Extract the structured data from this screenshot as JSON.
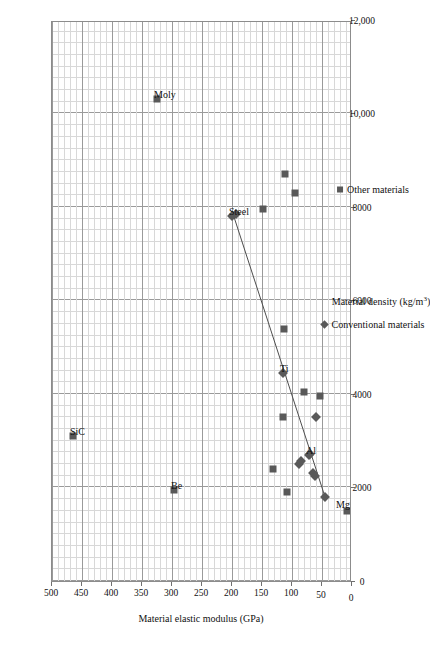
{
  "chart_data": {
    "type": "scatter",
    "title": "",
    "xlabel": "Material density (kg/m³)",
    "ylabel": "Material elastic modulus (GPa)",
    "xlim": [
      0,
      12000
    ],
    "ylim": [
      0,
      500
    ],
    "x_major_ticks": [
      0,
      2000,
      4000,
      6000,
      8000,
      10000,
      12000
    ],
    "x_tick_labels": [
      "0",
      "2000",
      "4000",
      "6000",
      "8000",
      "10,000",
      "12,000"
    ],
    "y_major_ticks": [
      0,
      50,
      100,
      150,
      200,
      250,
      300,
      350,
      400,
      450,
      500
    ],
    "y_tick_labels": [
      "0",
      "50",
      "100",
      "150",
      "200",
      "250",
      "300",
      "350",
      "400",
      "450",
      "500"
    ],
    "x_minor_step": 250,
    "y_minor_step": 10,
    "grid": "both",
    "rotation_deg": -90,
    "legend_position": "bottom",
    "legend": [
      {
        "name": "Conventional materials",
        "marker": "diamond",
        "color": "#595959"
      },
      {
        "name": "Other materials",
        "marker": "square",
        "color": "#595959"
      }
    ],
    "series": [
      {
        "name": "Conventional materials",
        "marker": "diamond",
        "color": "#595959",
        "points": [
          {
            "x": 7800,
            "y": 200,
            "label": "Steel"
          },
          {
            "x": 7850,
            "y": 193,
            "label": ""
          },
          {
            "x": 4450,
            "y": 115,
            "label": "Ti"
          },
          {
            "x": 3500,
            "y": 60,
            "label": ""
          },
          {
            "x": 2700,
            "y": 72,
            "label": "Al"
          },
          {
            "x": 2710,
            "y": 70,
            "label": ""
          },
          {
            "x": 2500,
            "y": 88,
            "label": ""
          },
          {
            "x": 2560,
            "y": 85,
            "label": ""
          },
          {
            "x": 2250,
            "y": 62,
            "label": ""
          },
          {
            "x": 2320,
            "y": 65,
            "label": ""
          },
          {
            "x": 1800,
            "y": 45,
            "label": "Mg"
          }
        ]
      },
      {
        "name": "Other materials",
        "marker": "square",
        "color": "#595959",
        "points": [
          {
            "x": 10300,
            "y": 325,
            "label": "Moly"
          },
          {
            "x": 8700,
            "y": 112,
            "label": ""
          },
          {
            "x": 8300,
            "y": 95,
            "label": ""
          },
          {
            "x": 7950,
            "y": 148,
            "label": ""
          },
          {
            "x": 5400,
            "y": 113,
            "label": ""
          },
          {
            "x": 4050,
            "y": 80,
            "label": ""
          },
          {
            "x": 3950,
            "y": 53,
            "label": ""
          },
          {
            "x": 3500,
            "y": 115,
            "label": ""
          },
          {
            "x": 3100,
            "y": 465,
            "label": "SiC"
          },
          {
            "x": 2400,
            "y": 132,
            "label": ""
          },
          {
            "x": 1950,
            "y": 297,
            "label": "Be"
          },
          {
            "x": 1900,
            "y": 108,
            "label": ""
          },
          {
            "x": 1500,
            "y": 8,
            "label": ""
          }
        ]
      }
    ],
    "trendline": {
      "name": "linear trend",
      "color": "#4d4d4d",
      "from": {
        "x": 7800,
        "y": 197
      },
      "to": {
        "x": 1800,
        "y": 45
      }
    },
    "point_labels": [
      "Moly",
      "Steel",
      "SiC",
      "Be",
      "Ti",
      "Al",
      "Mg"
    ]
  }
}
